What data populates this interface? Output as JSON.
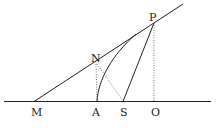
{
  "diagram": {
    "points": {
      "M": {
        "label": "M",
        "x": 34,
        "y": 101
      },
      "A": {
        "label": "A",
        "x": 97,
        "y": 101
      },
      "S": {
        "label": "S",
        "x": 123,
        "y": 101
      },
      "O": {
        "label": "O",
        "x": 154,
        "y": 101
      },
      "N": {
        "label": "N",
        "x": 96,
        "y": 62
      },
      "P": {
        "label": "P",
        "x": 154,
        "y": 23
      }
    },
    "labels": [
      "M",
      "A",
      "S",
      "O",
      "N",
      "P"
    ],
    "colors": {
      "ink": "#222222",
      "dotted": "#555555"
    }
  }
}
